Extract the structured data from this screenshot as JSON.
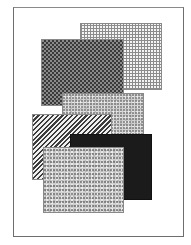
{
  "figure": {
    "frame_border_color": "#6e6e6e",
    "rectangles": [
      {
        "name": "grid-pattern-rect",
        "pattern": "grid",
        "x": 80,
        "y": 23,
        "w": 82,
        "h": 67
      },
      {
        "name": "checker-pattern-rect",
        "pattern": "checker",
        "x": 41,
        "y": 39,
        "w": 83,
        "h": 67
      },
      {
        "name": "speckle-pattern-rect-middle",
        "pattern": "speckle",
        "x": 62,
        "y": 93,
        "w": 82,
        "h": 65
      },
      {
        "name": "diagonal-stripe-rect",
        "pattern": "diagonal-stripes",
        "x": 32,
        "y": 114,
        "w": 80,
        "h": 66
      },
      {
        "name": "solid-black-rect",
        "pattern": "solid",
        "color": "#1b1b1b",
        "x": 70,
        "y": 134,
        "w": 82,
        "h": 66
      },
      {
        "name": "speckle-pattern-rect-bottom",
        "pattern": "speckle",
        "x": 43,
        "y": 147,
        "w": 81,
        "h": 66
      }
    ]
  }
}
